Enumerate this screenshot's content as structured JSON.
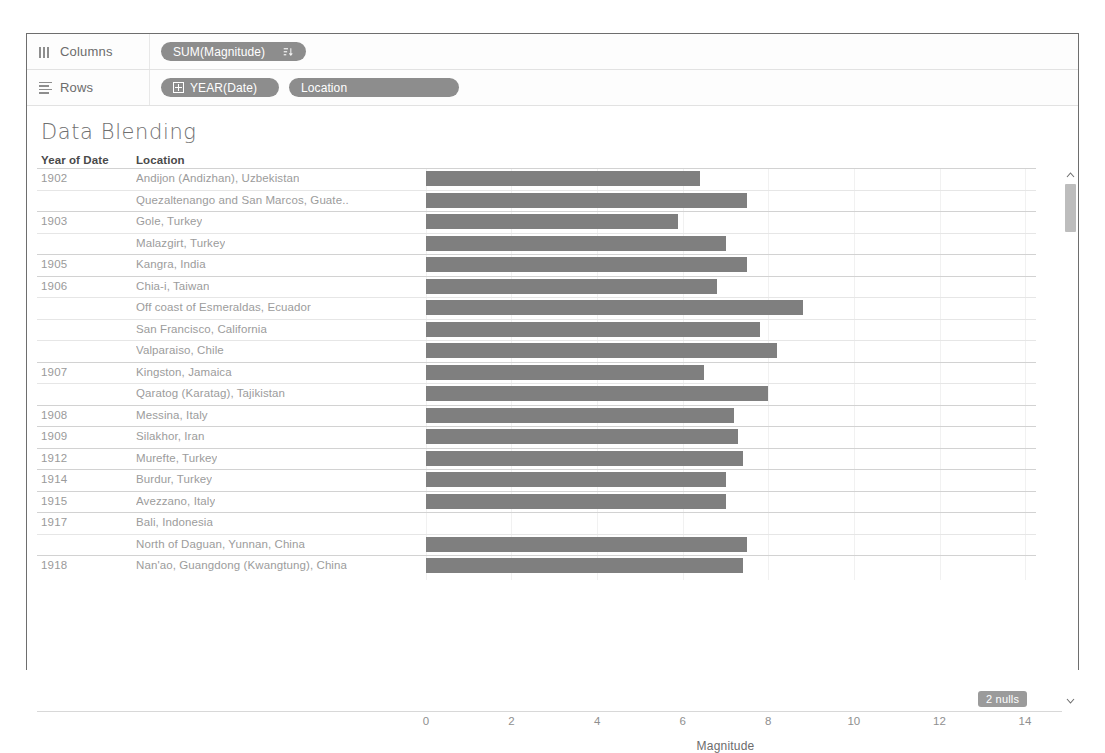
{
  "page_bleed_text": " ",
  "shelves": [
    {
      "name": "columns",
      "label": "Columns",
      "icon": "columns-icon",
      "pills": [
        {
          "label": "SUM(Magnitude)",
          "icon": "sort-descending-icon",
          "has_expand": false,
          "width_class": "wide-magnitude"
        }
      ]
    },
    {
      "name": "rows",
      "label": "Rows",
      "icon": "rows-icon",
      "pills": [
        {
          "label": "YEAR(Date)",
          "icon": "",
          "has_expand": true,
          "width_class": "year"
        },
        {
          "label": "Location",
          "icon": "",
          "has_expand": false,
          "width_class": "location"
        }
      ]
    }
  ],
  "worksheet": {
    "title": "Data Blending",
    "headers": {
      "year": "Year of Date",
      "location": "Location"
    },
    "nulls_badge": "2 nulls",
    "bar_color": "#7f7f7f",
    "pill_color": "#8d8d8d"
  },
  "chart_data": {
    "type": "bar",
    "title": "Data Blending",
    "xlabel": "Magnitude",
    "ylabel": "",
    "orientation": "horizontal",
    "xlim": [
      0,
      15
    ],
    "xticks": [
      0,
      2,
      4,
      6,
      8,
      10,
      12,
      14
    ],
    "grid": false,
    "legend": null,
    "null_count": 2,
    "measure": "SUM(Magnitude)",
    "dimensions": [
      "YEAR(Date)",
      "Location"
    ],
    "rows": [
      {
        "year": "1902",
        "location": "Andijon (Andizhan), Uzbekistan",
        "value": 6.4,
        "new_year": true
      },
      {
        "year": "",
        "location": "Quezaltenango and San Marcos, Guate..",
        "value": 7.5,
        "new_year": false
      },
      {
        "year": "1903",
        "location": "Gole, Turkey",
        "value": 5.9,
        "new_year": true
      },
      {
        "year": "",
        "location": "Malazgirt, Turkey",
        "value": 7.0,
        "new_year": false
      },
      {
        "year": "1905",
        "location": "Kangra, India",
        "value": 7.5,
        "new_year": true
      },
      {
        "year": "1906",
        "location": "Chia-i, Taiwan",
        "value": 6.8,
        "new_year": true
      },
      {
        "year": "",
        "location": "Off coast of Esmeraldas, Ecuador",
        "value": 8.8,
        "new_year": false
      },
      {
        "year": "",
        "location": "San Francisco, California",
        "value": 7.8,
        "new_year": false
      },
      {
        "year": "",
        "location": "Valparaiso, Chile",
        "value": 8.2,
        "new_year": false
      },
      {
        "year": "1907",
        "location": "Kingston, Jamaica",
        "value": 6.5,
        "new_year": true
      },
      {
        "year": "",
        "location": "Qaratog (Karatag), Tajikistan",
        "value": 8.0,
        "new_year": false
      },
      {
        "year": "1908",
        "location": "Messina, Italy",
        "value": 7.2,
        "new_year": true
      },
      {
        "year": "1909",
        "location": "Silakhor, Iran",
        "value": 7.3,
        "new_year": true
      },
      {
        "year": "1912",
        "location": "Murefte, Turkey",
        "value": 7.4,
        "new_year": true
      },
      {
        "year": "1914",
        "location": "Burdur, Turkey",
        "value": 7.0,
        "new_year": true
      },
      {
        "year": "1915",
        "location": "Avezzano, Italy",
        "value": 7.0,
        "new_year": true
      },
      {
        "year": "1917",
        "location": "Bali, Indonesia",
        "value": null,
        "new_year": true
      },
      {
        "year": "",
        "location": "North of Daguan, Yunnan, China",
        "value": 7.5,
        "new_year": false
      },
      {
        "year": "1918",
        "location": "Nan'ao, Guangdong (Kwangtung), China",
        "value": 7.4,
        "new_year": true
      }
    ]
  },
  "scrollbar": {
    "up_arrow": "chevron-up-icon",
    "down_arrow": "chevron-down-icon"
  }
}
